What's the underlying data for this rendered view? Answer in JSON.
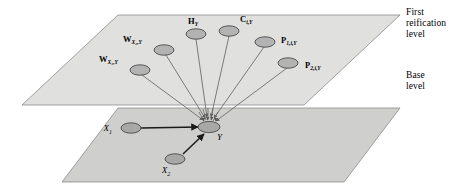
{
  "figure": {
    "type": "reification-level-diagram",
    "background_color": "#ffffff"
  },
  "levels": [
    {
      "id": "first-reification",
      "caption": "First\nreification\nlevel",
      "plane_fill": "#dededd",
      "plane_stroke": "#8a8a8a"
    },
    {
      "id": "base",
      "caption": "Base\nlevel",
      "plane_fill": "#cfcfce",
      "plane_stroke": "#8a8a8a"
    }
  ],
  "colors": {
    "node_fill": "#b3b3b3",
    "node_stroke": "#4a4a4a",
    "edge_stroke": "#6e6e6e",
    "base_edge_stroke": "#1a1a1a",
    "text": "#000000"
  },
  "reification_nodes": [
    {
      "id": "w-x1-y",
      "main": "W",
      "sub": "X₁,Y",
      "label_text": "WX1,Y",
      "cx": 140,
      "cy": 70,
      "label_x": 99,
      "label_y": 61,
      "label_anchor": "start"
    },
    {
      "id": "w-x2-y",
      "main": "W",
      "sub": "X₂,Y",
      "label_text": "WX2,Y",
      "cx": 164,
      "cy": 50,
      "label_x": 123,
      "label_y": 41,
      "label_anchor": "start"
    },
    {
      "id": "h-y",
      "main": "H",
      "sub": "Y",
      "label_text": "HY",
      "cx": 196,
      "cy": 34,
      "label_x": 188,
      "label_y": 23,
      "label_anchor": "start"
    },
    {
      "id": "c-i-y",
      "main": "C",
      "sub": "i,Y",
      "label_text": "Ci,Y",
      "cx": 229,
      "cy": 31,
      "label_x": 240,
      "label_y": 21,
      "label_anchor": "start"
    },
    {
      "id": "p1-i-y",
      "main": "P",
      "sub": "1,i,Y",
      "label_text": "P1,i,Y",
      "cx": 265,
      "cy": 42,
      "label_x": 281,
      "label_y": 42,
      "label_anchor": "start"
    },
    {
      "id": "p2-i-y",
      "main": "P",
      "sub": "2,i,Y",
      "label_text": "P2,i,Y",
      "cx": 288,
      "cy": 63,
      "label_x": 305,
      "label_y": 67,
      "label_anchor": "start"
    }
  ],
  "base_nodes": [
    {
      "id": "x1",
      "main": "X",
      "sub": "1",
      "label_text": "X1",
      "cx": 131,
      "cy": 128,
      "label_x": 112,
      "label_y": 131,
      "label_anchor": "end"
    },
    {
      "id": "x2",
      "main": "X",
      "sub": "2",
      "label_text": "X2",
      "cx": 175,
      "cy": 159,
      "label_x": 166,
      "label_y": 172,
      "label_anchor": "middle"
    },
    {
      "id": "y",
      "main": "Y",
      "sub": "",
      "label_text": "Y",
      "cx": 209,
      "cy": 127,
      "label_x": 216,
      "label_y": 140,
      "label_anchor": "start"
    }
  ],
  "base_edges": [
    {
      "id": "edge-x1-y",
      "from": "x1",
      "to": "y"
    },
    {
      "id": "edge-x2-y",
      "from": "x2",
      "to": "y"
    }
  ],
  "reification_edges": [
    {
      "id": "edge-w-x1-y",
      "from": "w-x1-y",
      "to": "y"
    },
    {
      "id": "edge-w-x2-y",
      "from": "w-x2-y",
      "to": "y"
    },
    {
      "id": "edge-h-y",
      "from": "h-y",
      "to": "y"
    },
    {
      "id": "edge-c-i-y",
      "from": "c-i-y",
      "to": "y"
    },
    {
      "id": "edge-p1-i-y",
      "from": "p1-i-y",
      "to": "y"
    },
    {
      "id": "edge-p2-i-y",
      "from": "p2-i-y",
      "to": "y"
    }
  ]
}
